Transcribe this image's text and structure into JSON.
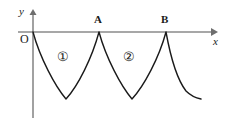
{
  "figure": {
    "background_color": "#ffffff",
    "width": 231,
    "height": 124
  },
  "axes": {
    "color": "#808080",
    "x_axis": {
      "label": "x",
      "label_name": "x-axis-label",
      "y_position": 32,
      "start_x": 18,
      "end_x": 216,
      "arrow": "right"
    },
    "y_axis": {
      "label": "y",
      "label_name": "y-axis-label",
      "x_position": 33,
      "start_y": 118,
      "end_y": 11,
      "arrow": "up"
    },
    "origin_label": "O"
  },
  "points": [
    {
      "label": "A",
      "x": 99,
      "y": 32,
      "note": "cusp on x-axis"
    },
    {
      "label": "B",
      "x": 166,
      "y": 32,
      "note": "cusp on x-axis"
    }
  ],
  "regions": [
    {
      "label": "①",
      "number": 1,
      "x": 62,
      "y": 57
    },
    {
      "label": "②",
      "number": 2,
      "x": 128,
      "y": 57
    }
  ],
  "curve": {
    "color": "#1a1a1a",
    "stroke_width": 1.4,
    "description": "Starts at origin O, dips to a rounded minimum, returns to a cusp at A, dips again to a rounded minimum, returns to a cusp at B, then decays to a flat tail on the right.",
    "arches": [
      {
        "start_x": 33,
        "min_x": 66,
        "min_y": 100,
        "end_x": 99
      },
      {
        "start_x": 99,
        "min_x": 132,
        "min_y": 100,
        "end_x": 166
      }
    ],
    "tail": {
      "start_x": 166,
      "end_x": 201,
      "end_y": 99
    },
    "path": "M 33,32 C 40,58 55,86 66,99 C 78,86 92,58 99,32 C 106,58 121,86 132,99 C 144,86 159,58 166,32 C 170,54 176,78 186,91 C 191,96 196,98 201,99"
  }
}
